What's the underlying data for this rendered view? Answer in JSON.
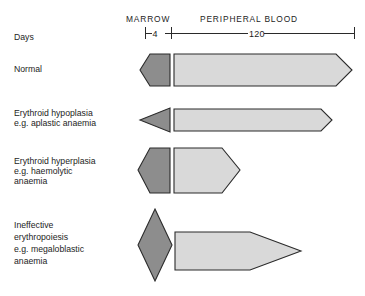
{
  "figure": {
    "type": "diagram",
    "title": "",
    "background_color": "#ffffff",
    "colors": {
      "marrow_fill": "#8d8d8d",
      "blood_fill": "#d9d9d9",
      "outline": "#2b2b2b",
      "text": "#1d1d1d"
    }
  },
  "header": {
    "marrow_label": "MARROW",
    "blood_label": "PERIPHERAL BLOOD",
    "axis_row_label": "Days",
    "marrow_days": "4",
    "blood_days": "120"
  },
  "rows": [
    {
      "label_lines": [
        "Normal"
      ],
      "marrow_shape": "left-pointing-pentagon",
      "blood_shape": "right-chevron-bar",
      "marrow_width_days": 4,
      "blood_width_days": 120,
      "marrow_height": "normal",
      "blood_height": "normal"
    },
    {
      "label_lines": [
        "Erythroid hypoplasia",
        "e.g. aplastic anaemia"
      ],
      "marrow_shape": "left-pointing-triangle",
      "blood_shape": "right-chevron-bar",
      "marrow_width_days": 4,
      "blood_width_days": 105,
      "marrow_height": "reduced",
      "blood_height": "reduced"
    },
    {
      "label_lines": [
        "Erythroid hyperplasia",
        "e.g. haemolytic",
        "anaemia"
      ],
      "marrow_shape": "left-pointing-pentagon",
      "blood_shape": "right-chevron-bar",
      "marrow_width_days": 4,
      "blood_width_days": 40,
      "marrow_height": "increased",
      "blood_height": "increased"
    },
    {
      "label_lines": [
        "Ineffective",
        "erythropoiesis",
        "e.g. megaloblastic",
        "anaemia"
      ],
      "marrow_shape": "diamond",
      "blood_shape": "tapered-spear",
      "marrow_width_days": 4,
      "blood_width_days": 78,
      "marrow_height": "greatly-increased",
      "blood_height": "greatly-reduced"
    }
  ],
  "geometry": {
    "marrow_axis_start_x": 145,
    "marrow_axis_end_x": 172,
    "blood_axis_end_x": 355,
    "axis_y": 33
  }
}
